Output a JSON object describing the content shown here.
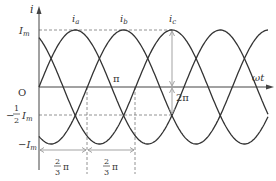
{
  "diagram": {
    "axes": {
      "y_label": "i",
      "x_label": "ωt",
      "origin_label": "O"
    },
    "levels": {
      "max_label": "I",
      "max_sub": "m",
      "half_neg_label_num": "1",
      "half_neg_label_den": "2",
      "half_neg_label_sym": "I",
      "half_neg_sub": "m",
      "min_label": "−I",
      "min_sub": "m",
      "minus_sign": "−"
    },
    "curves": [
      {
        "name": "i_a",
        "label": "i",
        "sub": "a",
        "phase_deg": 0
      },
      {
        "name": "i_b",
        "label": "i",
        "sub": "b",
        "phase_deg": -120
      },
      {
        "name": "i_c",
        "label": "i",
        "sub": "c",
        "phase_deg": -240
      }
    ],
    "annotations": {
      "pi": "π",
      "two_pi": "2π",
      "spacing_num": "2",
      "spacing_den": "3",
      "spacing_pi": "π"
    },
    "colors": {
      "curve": "#333333",
      "axis": "#444444",
      "dashed": "#777777",
      "arrow": "#999999"
    }
  }
}
